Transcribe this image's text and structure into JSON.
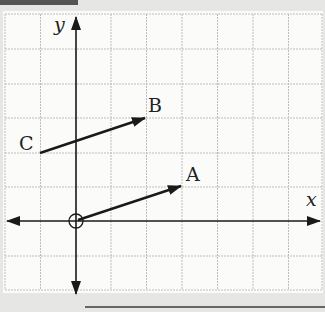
{
  "diagram": {
    "type": "coordinate-grid-vectors",
    "axes": {
      "x_label": "x",
      "y_label": "y"
    },
    "grid": {
      "columns": 9,
      "rows": 8,
      "origin_cell": {
        "col": 2,
        "row": 6
      }
    },
    "points": [
      {
        "label": "A",
        "coords": [
          3,
          1
        ]
      },
      {
        "label": "B",
        "coords": [
          2,
          3
        ]
      },
      {
        "label": "C",
        "coords": [
          -1,
          2
        ]
      }
    ],
    "vectors": [
      {
        "from": "O",
        "to": "A"
      },
      {
        "from": "C",
        "to": "B"
      }
    ],
    "origin_marker": "circle"
  },
  "labels": {
    "x": "x",
    "y": "y",
    "A": "A",
    "B": "B",
    "C": "C"
  }
}
